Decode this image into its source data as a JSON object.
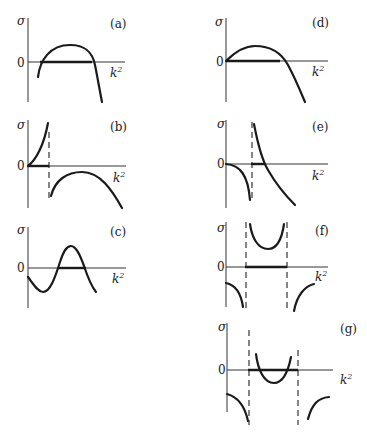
{
  "figure": {
    "axis_labels": {
      "y": "σ",
      "x": "k",
      "x_exp": "2",
      "origin": "0"
    },
    "panels": [
      {
        "id": "a",
        "label": "(a)"
      },
      {
        "id": "b",
        "label": "(b)"
      },
      {
        "id": "c",
        "label": "(c)"
      },
      {
        "id": "d",
        "label": "(d)"
      },
      {
        "id": "e",
        "label": "(e)"
      },
      {
        "id": "f",
        "label": "(f)"
      },
      {
        "id": "g",
        "label": "(g)"
      }
    ]
  },
  "colors": {
    "ink": "#1a1a1a",
    "background": "#ffffff"
  }
}
